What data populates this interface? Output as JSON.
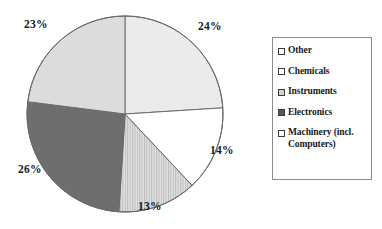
{
  "chart_data": {
    "type": "pie",
    "title": "",
    "subtitle": "",
    "xlabel": "",
    "ylabel": "",
    "grid": false,
    "legend_position": "right",
    "units": "percent",
    "start_angle_deg": 0,
    "direction": "clockwise",
    "categories": [
      "Other",
      "Chemicals",
      "Instruments",
      "Electronics",
      "Machinery (incl. Computers)"
    ],
    "values": [
      24,
      14,
      13,
      26,
      23
    ],
    "labels": [
      "24%",
      "14%",
      "13%",
      "26%",
      "23%"
    ],
    "slices": [
      {
        "name": "Other",
        "legend_label": "Other",
        "value": 24,
        "label": "24%",
        "fill": "#ebebeb",
        "pattern": "solid",
        "swatch_fill": "#fbfbfb"
      },
      {
        "name": "Chemicals",
        "legend_label": "Chemicals",
        "value": 14,
        "label": "14%",
        "fill": "#ffffff",
        "pattern": "solid",
        "swatch_fill": "#ffffff"
      },
      {
        "name": "Instruments",
        "legend_label": "Instruments",
        "value": 13,
        "label": "13%",
        "fill": "#d8d8d8",
        "pattern": "vertical-stripes",
        "swatch_fill": "#d2d2d2"
      },
      {
        "name": "Electronics",
        "legend_label": "Electronics",
        "value": 26,
        "label": "26%",
        "fill": "#6e6e6e",
        "pattern": "solid",
        "swatch_fill": "#595959"
      },
      {
        "name": "Machinery (incl. Computers)",
        "legend_label": "Machinery (incl. Computers)",
        "value": 23,
        "label": "23%",
        "fill": "#dcdcdc",
        "pattern": "solid",
        "swatch_fill": "#fdfdfd"
      }
    ]
  },
  "legend": {
    "items": [
      {
        "label": "Other"
      },
      {
        "label": "Chemicals"
      },
      {
        "label": "Instruments"
      },
      {
        "label": "Electronics"
      },
      {
        "label": "Machinery (incl. Computers)"
      }
    ]
  },
  "colors": {
    "outline": "#6a6a6a",
    "text": "#1a1a1a",
    "legend_border": "#8a8a8a",
    "background": "#ffffff"
  }
}
